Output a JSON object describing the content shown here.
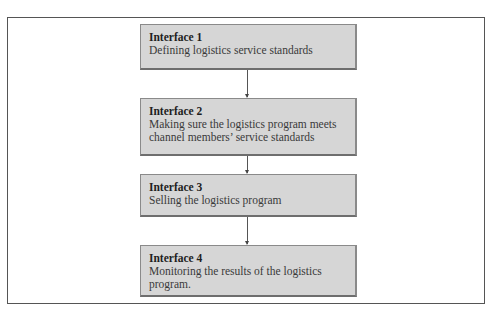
{
  "diagram": {
    "type": "vertical-flowchart",
    "steps": [
      {
        "title": "Interface 1",
        "description": "Defining logistics service standards"
      },
      {
        "title": "Interface 2",
        "description": "Making sure the logistics program meets channel members’ service standards"
      },
      {
        "title": "Interface 3",
        "description": "Selling the logistics program"
      },
      {
        "title": "Interface 4",
        "description": "Monitoring the results of the logistics program."
      }
    ],
    "colors": {
      "box_fill": "#d6d6d6",
      "box_border": "#8a8a8a",
      "frame_border": "#555555",
      "arrow": "#555555"
    }
  }
}
